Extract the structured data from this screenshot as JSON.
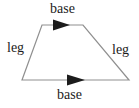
{
  "diagram": {
    "labels": {
      "top_base": "base",
      "left_leg": "leg",
      "right_leg": "leg",
      "bottom_base": "base"
    },
    "colors": {
      "line": "#8f8f8f",
      "arrow": "#1c1c1c",
      "text": "#1c1c1c",
      "background": "#ffffff"
    }
  }
}
